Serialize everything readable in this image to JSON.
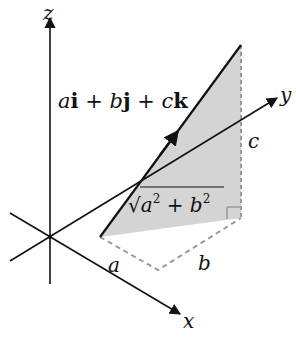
{
  "diagram": {
    "axes": {
      "x_label": "x",
      "y_label": "y",
      "z_label": "z"
    },
    "vector_label": {
      "a": "a",
      "i": "i",
      "plus1": " + ",
      "b": "b",
      "j": "j",
      "plus2": " + ",
      "c": "c",
      "k": "k"
    },
    "side_labels": {
      "a": "a",
      "b": "b",
      "c": "c"
    },
    "hypotenuse_label": {
      "radical": "√",
      "a": "a",
      "exp1": "2",
      "plus": " + ",
      "b": "b",
      "exp2": "2"
    },
    "colors": {
      "axis": "#111111",
      "fill": "#d4d4d4",
      "dashed": "#9a9a9a"
    }
  }
}
